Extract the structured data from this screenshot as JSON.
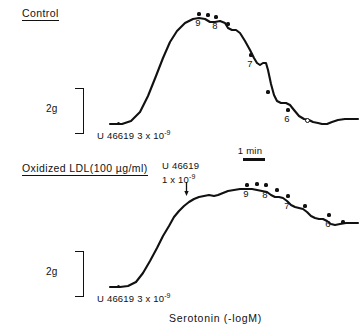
{
  "figure": {
    "axis_caption": "Serotonin (-logM)",
    "time_bar": {
      "label": "1 min"
    },
    "ink_color": "#111111",
    "background_color": "#ffffff"
  },
  "panels": [
    {
      "id": "control",
      "title": "Control",
      "scale_bar": {
        "label": "2g"
      },
      "agonist": {
        "name": "U 46619",
        "concentration": "3 x 10",
        "exponent": "-9"
      },
      "dose_labels": [
        "9",
        "8",
        "7",
        "6"
      ],
      "end_marker": "o"
    },
    {
      "id": "oxidized-ldl",
      "title": "Oxidized LDL(100 µg/ml)",
      "scale_bar": {
        "label": "2g"
      },
      "agonist": {
        "name": "U 46619",
        "concentration": "3 x 10",
        "exponent": "-9"
      },
      "second_agonist": {
        "name": "U 46619",
        "concentration": "1 x 10",
        "exponent": "-9"
      },
      "dose_labels": [
        "9",
        "8",
        "7",
        "6"
      ],
      "end_marker": "6"
    }
  ],
  "chart_data": {
    "type": "line",
    "xlabel": "Serotonin (-logM)",
    "ylabel": "Tension (g)",
    "scale_bar_g": 2,
    "time_bar_min": 1,
    "series": [
      {
        "name": "Control",
        "baseline_y": 124,
        "peak_y": 18,
        "points": [
          [
            110,
            124
          ],
          [
            122,
            124
          ],
          [
            131,
            121
          ],
          [
            140,
            112
          ],
          [
            148,
            96
          ],
          [
            156,
            76
          ],
          [
            163,
            58
          ],
          [
            170,
            42
          ],
          [
            177,
            31
          ],
          [
            185,
            23
          ],
          [
            193,
            19
          ],
          [
            199,
            18
          ],
          [
            205,
            19
          ],
          [
            210,
            22
          ],
          [
            215,
            22
          ],
          [
            220,
            21
          ],
          [
            225,
            23
          ],
          [
            228,
            28
          ],
          [
            232,
            30
          ],
          [
            236,
            30
          ],
          [
            240,
            33
          ],
          [
            245,
            41
          ],
          [
            250,
            50
          ],
          [
            254,
            58
          ],
          [
            257,
            63
          ],
          [
            260,
            65
          ],
          [
            263,
            63
          ],
          [
            266,
            63
          ],
          [
            268,
            70
          ],
          [
            271,
            84
          ],
          [
            274,
            95
          ],
          [
            277,
            101
          ],
          [
            281,
            103
          ],
          [
            286,
            103
          ],
          [
            290,
            105
          ],
          [
            294,
            110
          ],
          [
            299,
            116
          ],
          [
            304,
            119
          ],
          [
            309,
            120
          ],
          [
            313,
            122
          ],
          [
            318,
            123
          ],
          [
            322,
            124
          ],
          [
            327,
            124
          ],
          [
            332,
            122
          ],
          [
            338,
            120
          ],
          [
            345,
            119
          ],
          [
            352,
            119
          ],
          [
            358,
            119
          ]
        ],
        "dose_markers": [
          {
            "label": "9",
            "x": 199,
            "y": 14,
            "label_x": 196,
            "label_y": 18
          },
          {
            "label": "",
            "x": 208,
            "y": 15
          },
          {
            "label": "8",
            "x": 216,
            "y": 17,
            "label_x": 213,
            "label_y": 21
          },
          {
            "label": "",
            "x": 228,
            "y": 24
          },
          {
            "label": "7",
            "x": 251,
            "y": 55,
            "label_x": 248,
            "label_y": 59
          },
          {
            "label": "",
            "x": 268,
            "y": 92
          },
          {
            "label": "6",
            "x": 288,
            "y": 110,
            "label_x": 285,
            "label_y": 114
          }
        ],
        "open_marker": {
          "x": 307,
          "y": 120
        }
      },
      {
        "name": "Oxidized LDL",
        "baseline_y": 287,
        "peak_y": 189,
        "points": [
          [
            110,
            287
          ],
          [
            120,
            287
          ],
          [
            128,
            286
          ],
          [
            136,
            282
          ],
          [
            143,
            273
          ],
          [
            150,
            261
          ],
          [
            157,
            248
          ],
          [
            163,
            236
          ],
          [
            169,
            226
          ],
          [
            174,
            217
          ],
          [
            179,
            211
          ],
          [
            184,
            206
          ],
          [
            189,
            202
          ],
          [
            194,
            199
          ],
          [
            199,
            197
          ],
          [
            204,
            196
          ],
          [
            209,
            195
          ],
          [
            214,
            196
          ],
          [
            218,
            195
          ],
          [
            223,
            193
          ],
          [
            228,
            191
          ],
          [
            234,
            190
          ],
          [
            240,
            189
          ],
          [
            246,
            189
          ],
          [
            252,
            189
          ],
          [
            257,
            190
          ],
          [
            262,
            191
          ],
          [
            267,
            192
          ],
          [
            271,
            195
          ],
          [
            275,
            197
          ],
          [
            279,
            197
          ],
          [
            283,
            198
          ],
          [
            287,
            201
          ],
          [
            291,
            205
          ],
          [
            295,
            207
          ],
          [
            299,
            208
          ],
          [
            303,
            209
          ],
          [
            307,
            212
          ],
          [
            311,
            216
          ],
          [
            315,
            218
          ],
          [
            319,
            219
          ],
          [
            323,
            219
          ],
          [
            327,
            221
          ],
          [
            331,
            224
          ],
          [
            335,
            225
          ],
          [
            340,
            224
          ],
          [
            346,
            223
          ],
          [
            352,
            223
          ],
          [
            358,
            223
          ]
        ],
        "dose_markers": [
          {
            "label": "9",
            "x": 247,
            "y": 185,
            "label_x": 244,
            "label_y": 189
          },
          {
            "label": "",
            "x": 257,
            "y": 184
          },
          {
            "label": "8",
            "x": 266,
            "y": 185,
            "label_x": 263,
            "label_y": 190
          },
          {
            "label": "",
            "x": 277,
            "y": 190
          },
          {
            "label": "7",
            "x": 288,
            "y": 196,
            "label_x": 285,
            "label_y": 201
          },
          {
            "label": "",
            "x": 305,
            "y": 206
          },
          {
            "label": "6",
            "x": 329,
            "y": 215,
            "label_x": 326,
            "label_y": 219
          }
        ],
        "end_marker": {
          "x": 343,
          "y": 222
        }
      }
    ]
  },
  "layout": {
    "control_title": {
      "x": 22,
      "y": 7
    },
    "control_scale_label": {
      "x": 46,
      "y": 109
    },
    "control_bracket": {
      "x": 75,
      "y": 88,
      "w": 9,
      "h": 46
    },
    "control_baseline_dot": {
      "x": 117,
      "y": 122
    },
    "control_agonist_label": {
      "x": 97,
      "y": 127
    },
    "time_bar_label": {
      "x": 238,
      "y": 146
    },
    "time_bar": {
      "x": 243,
      "y": 158,
      "w": 22
    },
    "ldl_title": {
      "x": 22,
      "y": 162
    },
    "ldl_agonist2_label": {
      "x": 162,
      "y": 160
    },
    "ldl_arrow": {
      "x": 186,
      "y": 183,
      "h": 10
    },
    "ldl_scale_label": {
      "x": 46,
      "y": 272
    },
    "ldl_bracket": {
      "x": 75,
      "y": 251,
      "w": 9,
      "h": 46
    },
    "ldl_baseline_dot": {
      "x": 117,
      "y": 285
    },
    "ldl_agonist_label": {
      "x": 97,
      "y": 290
    },
    "axis_caption": {
      "x": 169,
      "y": 312
    }
  }
}
